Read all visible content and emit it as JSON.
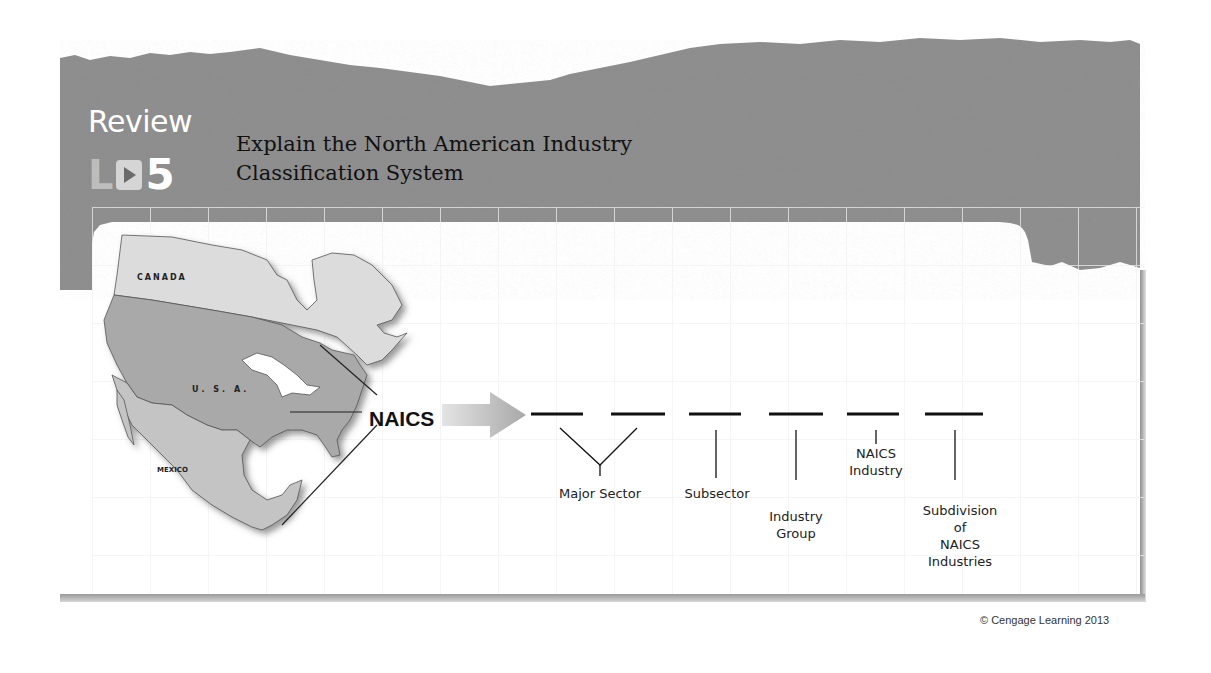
{
  "header": {
    "review_label": "Review",
    "lo_prefix": "LO",
    "lo_number": "5",
    "title_line1": "Explain the North American Industry",
    "title_line2": "Classification System"
  },
  "map": {
    "countries": [
      "CANADA",
      "U. S. A.",
      "MEXICO"
    ],
    "center_label": "NAICS"
  },
  "code_structure": {
    "digit_slots": 6,
    "levels": [
      {
        "label": "Major Sector",
        "digits": "1-2"
      },
      {
        "label": "Subsector",
        "digits": "3"
      },
      {
        "label": "Industry Group",
        "digits": "4"
      },
      {
        "label": "NAICS Industry",
        "digits": "5"
      },
      {
        "label": "Subdivision of NAICS Industries",
        "digits": "6"
      }
    ],
    "label_lines": {
      "major_sector": "Major Sector",
      "subsector": "Subsector",
      "industry_group_1": "Industry",
      "industry_group_2": "Group",
      "naics_industry_1": "NAICS",
      "naics_industry_2": "Industry",
      "subdivision_1": "Subdivision",
      "subdivision_2": "of",
      "subdivision_3": "NAICS",
      "subdivision_4": "Industries"
    }
  },
  "footer": {
    "copyright": "© Cengage Learning 2013"
  },
  "colors": {
    "banner_gray": "#8e8e8e",
    "map_canada": "#dcdcdc",
    "map_usa": "#a9a9a9",
    "map_mexico": "#c4c4c4"
  }
}
